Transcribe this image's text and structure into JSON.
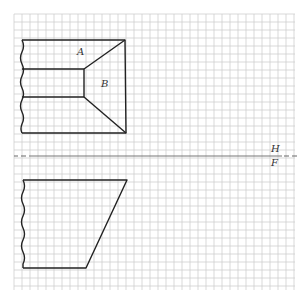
{
  "diagram": {
    "type": "orthographic-projection-exercise",
    "grid": {
      "x0": 14,
      "y0": 14,
      "x1": 295,
      "y1": 290,
      "spacing": 8,
      "line_color": "#c8c8c8"
    },
    "fold_line": {
      "y": 156,
      "label_top": "H",
      "label_bottom": "F",
      "color": "#555555"
    },
    "top_view": {
      "surface_labels": [
        "A",
        "B"
      ]
    },
    "front_view": {},
    "stroke_color": "#222222"
  },
  "labels": {
    "A": "A",
    "B": "B",
    "H": "H",
    "F": "F"
  }
}
